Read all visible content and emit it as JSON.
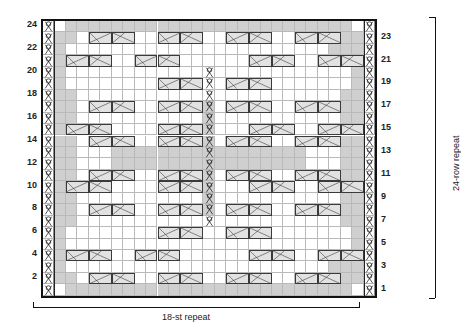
{
  "chart_data": {
    "type": "heatmap",
    "title": "",
    "grid": {
      "rows": 24,
      "columns": 29,
      "row_numbers_left": [
        24,
        22,
        20,
        18,
        16,
        14,
        12,
        10,
        8,
        6,
        4,
        2
      ],
      "row_numbers_right": [
        23,
        21,
        19,
        17,
        15,
        13,
        11,
        9,
        7,
        5,
        3,
        1
      ],
      "row_order": "bottom-to-top, row 1 at bottom",
      "side_stitch_columns": [
        0,
        28
      ],
      "repeat_columns_start": 1,
      "repeat_columns_end": 27
    },
    "legend_colors": {
      "knit_background": "#ffffff",
      "purl_shaded": "#cfcfcf",
      "cable_fill": "#e2e2e2",
      "cable_outline": "#3a3a3a",
      "grid_line": "#b9b9b9",
      "border": "#111111"
    },
    "symbols": {
      "knot": "knot-stitch-icon",
      "cable_right": "cable-cross-right-icon",
      "cable_left": "cable-cross-left-icon",
      "purl": "purl-cell",
      "knit": "knit-cell"
    },
    "annotations": {
      "stitch_repeat": "18-st repeat",
      "row_repeat": "24-row repeat"
    },
    "purl_cells": [
      {
        "row": 1,
        "cols": [
          2,
          3,
          4,
          5,
          6,
          7,
          8,
          9,
          10,
          11,
          12,
          13,
          14,
          15,
          16,
          17,
          18,
          19,
          20,
          21,
          22,
          23,
          24,
          25,
          26
        ]
      },
      {
        "row": 2,
        "cols": [
          1,
          2,
          25,
          26,
          27
        ]
      },
      {
        "row": 3,
        "cols": [
          1,
          25,
          26,
          27
        ]
      },
      {
        "row": 4,
        "cols": [
          1,
          26,
          27
        ]
      },
      {
        "row": 5,
        "cols": [
          1,
          27
        ]
      },
      {
        "row": 6,
        "cols": [
          1,
          27
        ]
      },
      {
        "row": 7,
        "cols": [
          1,
          2,
          26,
          27
        ]
      },
      {
        "row": 8,
        "cols": [
          1,
          2,
          14,
          26,
          27
        ]
      },
      {
        "row": 9,
        "cols": [
          1,
          2,
          14,
          26,
          27
        ]
      },
      {
        "row": 10,
        "cols": [
          1,
          2,
          14,
          26,
          27
        ]
      },
      {
        "row": 11,
        "cols": [
          1,
          2,
          14,
          26,
          27
        ]
      },
      {
        "row": 12,
        "cols": [
          1,
          2,
          6,
          7,
          8,
          9,
          10,
          11,
          12,
          13,
          14,
          15,
          16,
          17,
          18,
          19,
          20,
          21,
          22,
          26,
          27
        ]
      },
      {
        "row": 13,
        "cols": [
          1,
          2,
          6,
          7,
          8,
          9,
          10,
          11,
          12,
          13,
          14,
          15,
          16,
          17,
          18,
          19,
          20,
          21,
          22,
          26,
          27
        ]
      },
      {
        "row": 14,
        "cols": [
          1,
          2,
          14,
          26,
          27
        ]
      },
      {
        "row": 15,
        "cols": [
          1,
          2,
          14,
          26,
          27
        ]
      },
      {
        "row": 16,
        "cols": [
          1,
          2,
          14,
          26,
          27
        ]
      },
      {
        "row": 17,
        "cols": [
          1,
          2,
          14,
          26,
          27
        ]
      },
      {
        "row": 18,
        "cols": [
          1,
          2,
          26,
          27
        ]
      },
      {
        "row": 19,
        "cols": [
          1,
          27
        ]
      },
      {
        "row": 20,
        "cols": [
          1,
          27
        ]
      },
      {
        "row": 21,
        "cols": [
          1,
          26,
          27
        ]
      },
      {
        "row": 22,
        "cols": [
          1,
          25,
          26,
          27
        ]
      },
      {
        "row": 23,
        "cols": [
          1,
          2,
          25,
          26,
          27
        ]
      },
      {
        "row": 24,
        "cols": [
          2,
          3,
          4,
          5,
          6,
          7,
          8,
          9,
          10,
          11,
          12,
          13,
          14,
          15,
          16,
          17,
          18,
          19,
          20,
          21,
          22,
          23,
          24,
          25,
          26
        ]
      }
    ],
    "cables": [
      {
        "row": 2,
        "col": 4,
        "dir": "right"
      },
      {
        "row": 2,
        "col": 6,
        "dir": "left"
      },
      {
        "row": 2,
        "col": 10,
        "dir": "right"
      },
      {
        "row": 2,
        "col": 12,
        "dir": "left"
      },
      {
        "row": 2,
        "col": 16,
        "dir": "right"
      },
      {
        "row": 2,
        "col": 18,
        "dir": "left"
      },
      {
        "row": 2,
        "col": 22,
        "dir": "right"
      },
      {
        "row": 2,
        "col": 24,
        "dir": "left"
      },
      {
        "row": 4,
        "col": 2,
        "dir": "right"
      },
      {
        "row": 4,
        "col": 4,
        "dir": "left"
      },
      {
        "row": 4,
        "col": 8,
        "dir": "right"
      },
      {
        "row": 4,
        "col": 10,
        "dir": "left"
      },
      {
        "row": 4,
        "col": 18,
        "dir": "right"
      },
      {
        "row": 4,
        "col": 20,
        "dir": "left"
      },
      {
        "row": 4,
        "col": 24,
        "dir": "right"
      },
      {
        "row": 4,
        "col": 26,
        "dir": "left"
      },
      {
        "row": 6,
        "col": 10,
        "dir": "right"
      },
      {
        "row": 6,
        "col": 12,
        "dir": "left"
      },
      {
        "row": 6,
        "col": 16,
        "dir": "right"
      },
      {
        "row": 6,
        "col": 18,
        "dir": "left"
      },
      {
        "row": 8,
        "col": 4,
        "dir": "right"
      },
      {
        "row": 8,
        "col": 6,
        "dir": "left"
      },
      {
        "row": 8,
        "col": 10,
        "dir": "right"
      },
      {
        "row": 8,
        "col": 12,
        "dir": "left"
      },
      {
        "row": 8,
        "col": 16,
        "dir": "right"
      },
      {
        "row": 8,
        "col": 18,
        "dir": "left"
      },
      {
        "row": 8,
        "col": 22,
        "dir": "right"
      },
      {
        "row": 8,
        "col": 24,
        "dir": "left"
      },
      {
        "row": 10,
        "col": 2,
        "dir": "right"
      },
      {
        "row": 10,
        "col": 4,
        "dir": "left"
      },
      {
        "row": 10,
        "col": 10,
        "dir": "right"
      },
      {
        "row": 10,
        "col": 12,
        "dir": "left"
      },
      {
        "row": 10,
        "col": 18,
        "dir": "right"
      },
      {
        "row": 10,
        "col": 20,
        "dir": "left"
      },
      {
        "row": 10,
        "col": 24,
        "dir": "right"
      },
      {
        "row": 10,
        "col": 26,
        "dir": "left"
      },
      {
        "row": 11,
        "col": 4,
        "dir": "right"
      },
      {
        "row": 11,
        "col": 6,
        "dir": "left"
      },
      {
        "row": 11,
        "col": 10,
        "dir": "right"
      },
      {
        "row": 11,
        "col": 12,
        "dir": "left"
      },
      {
        "row": 11,
        "col": 16,
        "dir": "right"
      },
      {
        "row": 11,
        "col": 18,
        "dir": "left"
      },
      {
        "row": 11,
        "col": 22,
        "dir": "right"
      },
      {
        "row": 11,
        "col": 24,
        "dir": "left"
      },
      {
        "row": 14,
        "col": 4,
        "dir": "right"
      },
      {
        "row": 14,
        "col": 6,
        "dir": "left"
      },
      {
        "row": 14,
        "col": 10,
        "dir": "right"
      },
      {
        "row": 14,
        "col": 12,
        "dir": "left"
      },
      {
        "row": 14,
        "col": 16,
        "dir": "right"
      },
      {
        "row": 14,
        "col": 18,
        "dir": "left"
      },
      {
        "row": 14,
        "col": 22,
        "dir": "right"
      },
      {
        "row": 14,
        "col": 24,
        "dir": "left"
      },
      {
        "row": 15,
        "col": 2,
        "dir": "right"
      },
      {
        "row": 15,
        "col": 4,
        "dir": "left"
      },
      {
        "row": 15,
        "col": 10,
        "dir": "right"
      },
      {
        "row": 15,
        "col": 12,
        "dir": "left"
      },
      {
        "row": 15,
        "col": 18,
        "dir": "right"
      },
      {
        "row": 15,
        "col": 20,
        "dir": "left"
      },
      {
        "row": 15,
        "col": 24,
        "dir": "right"
      },
      {
        "row": 15,
        "col": 26,
        "dir": "left"
      },
      {
        "row": 17,
        "col": 4,
        "dir": "right"
      },
      {
        "row": 17,
        "col": 6,
        "dir": "left"
      },
      {
        "row": 17,
        "col": 10,
        "dir": "right"
      },
      {
        "row": 17,
        "col": 12,
        "dir": "left"
      },
      {
        "row": 17,
        "col": 16,
        "dir": "right"
      },
      {
        "row": 17,
        "col": 18,
        "dir": "left"
      },
      {
        "row": 17,
        "col": 22,
        "dir": "right"
      },
      {
        "row": 17,
        "col": 24,
        "dir": "left"
      },
      {
        "row": 19,
        "col": 10,
        "dir": "right"
      },
      {
        "row": 19,
        "col": 12,
        "dir": "left"
      },
      {
        "row": 19,
        "col": 16,
        "dir": "right"
      },
      {
        "row": 19,
        "col": 18,
        "dir": "left"
      },
      {
        "row": 21,
        "col": 2,
        "dir": "right"
      },
      {
        "row": 21,
        "col": 4,
        "dir": "left"
      },
      {
        "row": 21,
        "col": 8,
        "dir": "right"
      },
      {
        "row": 21,
        "col": 10,
        "dir": "left"
      },
      {
        "row": 21,
        "col": 18,
        "dir": "right"
      },
      {
        "row": 21,
        "col": 20,
        "dir": "left"
      },
      {
        "row": 21,
        "col": 24,
        "dir": "right"
      },
      {
        "row": 21,
        "col": 26,
        "dir": "left"
      },
      {
        "row": 23,
        "col": 4,
        "dir": "right"
      },
      {
        "row": 23,
        "col": 6,
        "dir": "left"
      },
      {
        "row": 23,
        "col": 10,
        "dir": "right"
      },
      {
        "row": 23,
        "col": 12,
        "dir": "left"
      },
      {
        "row": 23,
        "col": 16,
        "dir": "right"
      },
      {
        "row": 23,
        "col": 18,
        "dir": "left"
      },
      {
        "row": 23,
        "col": 22,
        "dir": "right"
      },
      {
        "row": 23,
        "col": 24,
        "dir": "left"
      }
    ],
    "knot_columns": [
      0,
      28
    ],
    "knot_center_column_rows": [
      7,
      8,
      9,
      10,
      11,
      12,
      13,
      14,
      15,
      16,
      17,
      18,
      19,
      20
    ],
    "knot_center_column": 14
  }
}
